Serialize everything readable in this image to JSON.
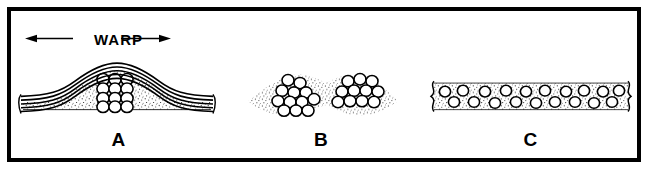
{
  "figure": {
    "background_color": "#ffffff",
    "ink_color": "#000000",
    "border_color": "#000000",
    "border_width_px": 4
  },
  "annotation": {
    "warp_label": "WARP",
    "arrow_icon": "double-headed-horizontal-arrow"
  },
  "panels": [
    {
      "id": "a",
      "label": "A",
      "description": "crimped warp yarns arching over a compact rectangular fiber bundle embedded in stippled matrix",
      "warp_line_count": 5,
      "fiber_rows": 4,
      "fiber_columns": 3,
      "fiber_count": 12,
      "fiber_packing": "square-grid",
      "matrix_texture": "stipple"
    },
    {
      "id": "b",
      "label": "B",
      "description": "two separated fiber clusters forming an hourglass silhouette in stippled matrix",
      "cluster_count": 2,
      "fiber_count": 23,
      "fiber_packing": "staggered-hexagonal",
      "matrix_texture": "stipple"
    },
    {
      "id": "c",
      "label": "C",
      "description": "flattened wide band with two staggered rows of dispersed fibers in stippled matrix",
      "fiber_rows": 2,
      "fiber_count": 23,
      "fiber_packing": "dispersed-two-row",
      "matrix_texture": "stipple",
      "end_marks": "wavy-bracket"
    }
  ]
}
